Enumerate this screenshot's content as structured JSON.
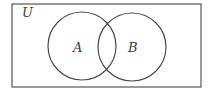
{
  "diagram": {
    "type": "venn",
    "universe_label": "U",
    "sets": [
      {
        "label": "A"
      },
      {
        "label": "B"
      }
    ],
    "stroke_color": "#4a4a4a",
    "background": "#ffffff"
  }
}
